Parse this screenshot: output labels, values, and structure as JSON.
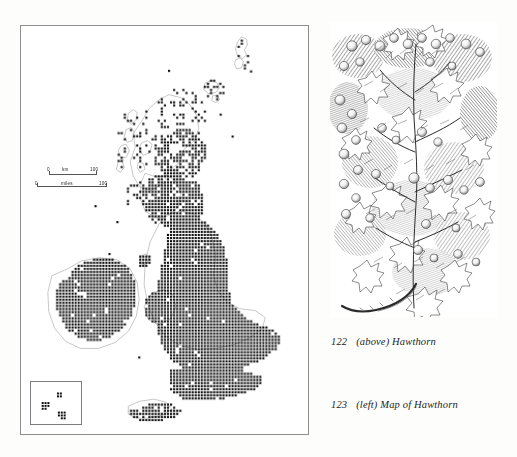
{
  "page": {
    "background_color": "#fdfdfc",
    "ink_color": "#1d1d1d"
  },
  "map": {
    "name": "Map of Hawthorn",
    "frame_color": "#8d8d8d",
    "dot_color": "#111111",
    "coast_color": "#8a8a8a",
    "scale_bar": {
      "km": {
        "zero": "0",
        "unit": "km",
        "max": "100"
      },
      "miles": {
        "zero": "0",
        "unit": "miles",
        "max": "100"
      }
    },
    "inset": {
      "name": "channel-islands-inset"
    }
  },
  "illustration": {
    "name": "hawthorn-engraving",
    "subject": "Hawthorn",
    "description": "Botanical engraving of hawthorn branch with berries and lobed leaves"
  },
  "captions": [
    {
      "number": "122",
      "position": "(above)",
      "title": "Hawthorn",
      "full": "122   (above) Hawthorn"
    },
    {
      "number": "123",
      "position": "(left)",
      "title": "Map of Hawthorn",
      "full": "123   (left) Map of Hawthorn"
    }
  ],
  "chart_data": {
    "type": "map",
    "title": "Map of Hawthorn",
    "region": "Britain and Ireland",
    "symbology": "filled square dot per 10-km grid square where species recorded",
    "scale_km": [
      0,
      100
    ],
    "scale_miles": [
      0,
      100
    ],
    "coverage_notes": [
      "Dense continuous coverage across England, Wales and Ireland",
      "Moderate coverage across southern and eastern Scotland",
      "Sparse scattered records in the Scottish Highlands and Hebrides",
      "Few isolated records in Orkney and Shetland",
      "Channel Islands shown in separate inset box, recorded"
    ]
  }
}
